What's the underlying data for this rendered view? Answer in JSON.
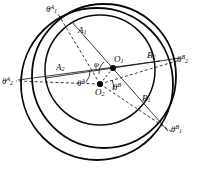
{
  "figure": {
    "stroke_color": "#0b0b0b",
    "background": "#ffffff",
    "circles": [
      {
        "name": "outer-circle",
        "cx": 97,
        "cy": 84,
        "r": 76,
        "style": "solid",
        "width": 1.7
      },
      {
        "name": "middle-circle",
        "cx": 104,
        "cy": 76,
        "r": 72,
        "style": "solid",
        "width": 1.7
      },
      {
        "name": "inner-circle",
        "cx": 100,
        "cy": 70,
        "r": 55,
        "style": "solid",
        "width": 1.5
      }
    ],
    "centers": [
      {
        "name": "O1",
        "label": "O",
        "sub": "1",
        "x": 113,
        "y": 68
      },
      {
        "name": "O2",
        "label": "O",
        "sub": "2",
        "x": 100,
        "y": 84
      }
    ],
    "angles": [
      {
        "name": "phi",
        "label": "φ",
        "vertex": "O1"
      },
      {
        "name": "theta-A",
        "label": "θ",
        "sup": "A",
        "vertex": "O2"
      },
      {
        "name": "theta-B",
        "label": "θ",
        "sup": "B",
        "vertex": "O2"
      }
    ],
    "points": [
      {
        "name": "A1",
        "label": "A",
        "sub": "1",
        "x": 79,
        "y": 28
      },
      {
        "name": "A2",
        "label": "A",
        "sub": "2",
        "x": 57,
        "y": 65
      },
      {
        "name": "B1",
        "label": "B",
        "sub": "1",
        "x": 143,
        "y": 96
      },
      {
        "name": "B2",
        "label": "B",
        "sub": "2",
        "x": 149,
        "y": 53
      }
    ],
    "rays": [
      {
        "name": "theta-1-A",
        "label": "θ",
        "sub": "1",
        "sup": "A",
        "x": 48,
        "y": 5
      },
      {
        "name": "theta-2-A",
        "label": "θ",
        "sub": "2",
        "sup": "A",
        "x": 4,
        "y": 78
      },
      {
        "name": "theta-2-B",
        "label": "θ",
        "sub": "2",
        "sup": "B",
        "x": 178,
        "y": 56
      },
      {
        "name": "theta-1-B",
        "label": "θ",
        "sub": "1",
        "sup": "B",
        "x": 172,
        "y": 126
      }
    ]
  }
}
